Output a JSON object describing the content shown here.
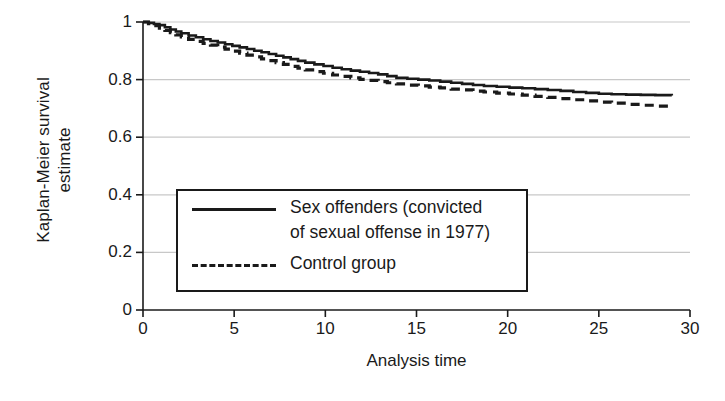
{
  "chart_data": {
    "type": "line",
    "title": "",
    "xlabel": "Analysis time",
    "ylabel_lines": [
      "Kaplan-Meier survival",
      "estimate"
    ],
    "ylabel": "Kaplan-Meier survival estimate",
    "xlim": [
      0,
      30
    ],
    "ylim": [
      0,
      1
    ],
    "xticks": [
      0,
      5,
      10,
      15,
      20,
      25,
      30
    ],
    "xtick_labels": [
      "0",
      "5",
      "10",
      "15",
      "20",
      "25",
      "30"
    ],
    "yticks": [
      0,
      0.2,
      0.4,
      0.6,
      0.8,
      1
    ],
    "ytick_labels": [
      "0",
      "0.2",
      "0.4",
      "0.6",
      "0.8",
      "1"
    ],
    "grid": "horizontal",
    "grid_color": "#c8c8c8",
    "axis_color": "#1a1a1a",
    "legend_position": "center-left",
    "legend": [
      {
        "name": "Sex offenders (convicted of sexual offense in 1977)",
        "label_lines": [
          "Sex offenders (convicted",
          "of sexual offense in 1977)"
        ],
        "style": "solid"
      },
      {
        "name": "Control group",
        "label_lines": [
          "Control group"
        ],
        "style": "dashed"
      }
    ],
    "series": [
      {
        "name": "Sex offenders (convicted of sexual offense in 1977)",
        "style": "solid",
        "color": "#1a1a1a",
        "x": [
          0,
          0.3,
          0.6,
          0.9,
          1.2,
          1.5,
          1.8,
          2.1,
          2.5,
          2.9,
          3.3,
          3.7,
          4.1,
          4.5,
          4.9,
          5.3,
          5.7,
          6.1,
          6.5,
          6.9,
          7.3,
          7.7,
          8.1,
          8.5,
          8.9,
          9.4,
          9.9,
          10.4,
          10.9,
          11.4,
          11.9,
          12.4,
          12.9,
          13.4,
          13.9,
          14.5,
          15.1,
          15.7,
          16.3,
          16.9,
          17.5,
          18.1,
          18.7,
          19.4,
          20.1,
          20.8,
          21.5,
          22.2,
          22.9,
          23.6,
          24.3,
          25.0,
          25.7,
          26.5,
          27.3,
          28.1,
          29.0
        ],
        "y": [
          1.0,
          0.997,
          0.993,
          0.989,
          0.982,
          0.974,
          0.967,
          0.961,
          0.953,
          0.947,
          0.94,
          0.934,
          0.929,
          0.923,
          0.917,
          0.912,
          0.906,
          0.9,
          0.895,
          0.889,
          0.883,
          0.877,
          0.871,
          0.865,
          0.859,
          0.853,
          0.847,
          0.841,
          0.836,
          0.831,
          0.827,
          0.823,
          0.818,
          0.812,
          0.806,
          0.803,
          0.8,
          0.797,
          0.793,
          0.789,
          0.785,
          0.781,
          0.778,
          0.775,
          0.772,
          0.77,
          0.767,
          0.764,
          0.761,
          0.757,
          0.754,
          0.751,
          0.749,
          0.748,
          0.747,
          0.746,
          0.745
        ]
      },
      {
        "name": "Control group",
        "style": "dashed",
        "color": "#1a1a1a",
        "x": [
          0,
          0.3,
          0.6,
          0.9,
          1.2,
          1.5,
          1.8,
          2.1,
          2.5,
          2.9,
          3.3,
          3.7,
          4.1,
          4.5,
          4.9,
          5.3,
          5.7,
          6.1,
          6.5,
          6.9,
          7.3,
          7.7,
          8.1,
          8.5,
          8.9,
          9.4,
          9.9,
          10.4,
          10.9,
          11.4,
          11.9,
          12.4,
          12.9,
          13.4,
          13.9,
          14.5,
          15.1,
          15.7,
          16.3,
          16.9,
          17.5,
          18.1,
          18.7,
          19.4,
          20.1,
          20.8,
          21.5,
          22.2,
          22.9,
          23.6,
          24.3,
          25.0,
          25.7,
          26.5,
          27.3,
          28.1,
          29.0
        ],
        "y": [
          1.0,
          0.994,
          0.987,
          0.979,
          0.971,
          0.963,
          0.955,
          0.948,
          0.94,
          0.933,
          0.926,
          0.92,
          0.913,
          0.906,
          0.899,
          0.892,
          0.885,
          0.879,
          0.872,
          0.866,
          0.859,
          0.853,
          0.846,
          0.84,
          0.834,
          0.828,
          0.822,
          0.816,
          0.811,
          0.806,
          0.801,
          0.797,
          0.793,
          0.789,
          0.785,
          0.781,
          0.778,
          0.774,
          0.771,
          0.767,
          0.764,
          0.76,
          0.757,
          0.753,
          0.75,
          0.746,
          0.742,
          0.738,
          0.734,
          0.73,
          0.726,
          0.722,
          0.718,
          0.714,
          0.711,
          0.708,
          0.705
        ]
      }
    ]
  }
}
